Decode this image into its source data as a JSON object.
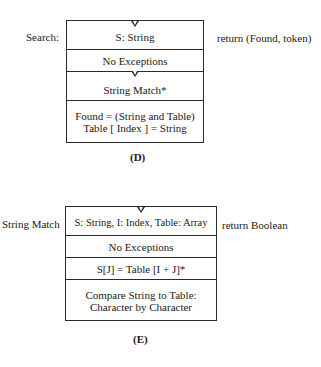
{
  "diagram_d": {
    "left_label": "Search:",
    "right_label": "return (Found, token)",
    "rows": [
      "S: String",
      "No Exceptions",
      "String Match*",
      "Found = (String and Table)",
      "Table [ Index ] = String"
    ],
    "caption": "(D)"
  },
  "diagram_e": {
    "left_label": "String Match",
    "right_label": "return Boolean",
    "rows": [
      "S: String, I: Index, Table: Array",
      "No Exceptions",
      "S[J] = Table [I + J]*",
      "Compare String to Table:",
      "Character by Character"
    ],
    "caption": "(E)"
  }
}
